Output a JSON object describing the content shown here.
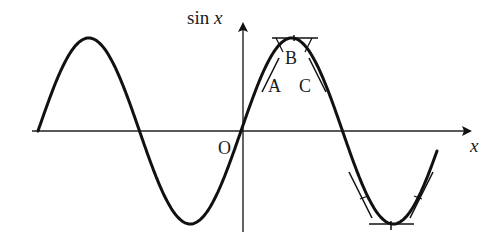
{
  "figure": {
    "y_axis_label_fn": "sin",
    "y_axis_label_var": "x",
    "x_axis_label": "x",
    "origin_label": "O",
    "point_labels": {
      "A": "A",
      "B": "B",
      "C": "C"
    }
  },
  "colors": {
    "curve": "#111111",
    "axis": "#222222",
    "background": "#ffffff"
  },
  "curve": {
    "function": "sin",
    "description": "Sine curve spanning about two periods, with tangent segments drawn at points A, B, C near the crest and at symmetric points near the trough"
  }
}
